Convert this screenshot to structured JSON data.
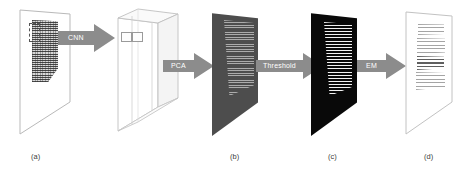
{
  "figure": {
    "type": "pipeline-diagram",
    "background_color": "#ffffff",
    "caption_color": "#3c3c3c",
    "arrow_color": "#8c8c8c",
    "arrow_label_color": "#ffffff",
    "arrow_label_box_color": "#6e6e6e"
  },
  "arrows": [
    {
      "id": "cnn",
      "label": "CNN"
    },
    {
      "id": "pca",
      "label": "PCA"
    },
    {
      "id": "threshold",
      "label": "Threshold"
    },
    {
      "id": "em",
      "label": "EM"
    }
  ],
  "panels": [
    {
      "id": "source-document",
      "caption": "(a)",
      "description": "scanned document sheet with dense handwritten text block and dashed patch selector"
    },
    {
      "id": "cnn-feature-volume",
      "caption": "",
      "description": "3D slab of CNN feature maps with two highlighted patch rectangles"
    },
    {
      "id": "pca-map",
      "caption": "(b)",
      "description": "dark grey PCA projection map with fine horizontal striping"
    },
    {
      "id": "threshold-map",
      "caption": "(c)",
      "description": "binary thresholded mask, black background with white horizontal line strokes"
    },
    {
      "id": "em-result",
      "caption": "(d)",
      "description": "cleaned output document sheet with restored text lines"
    }
  ],
  "captions": {
    "a": "(a)",
    "b": "(b)",
    "c": "(c)",
    "d": "(d)"
  }
}
